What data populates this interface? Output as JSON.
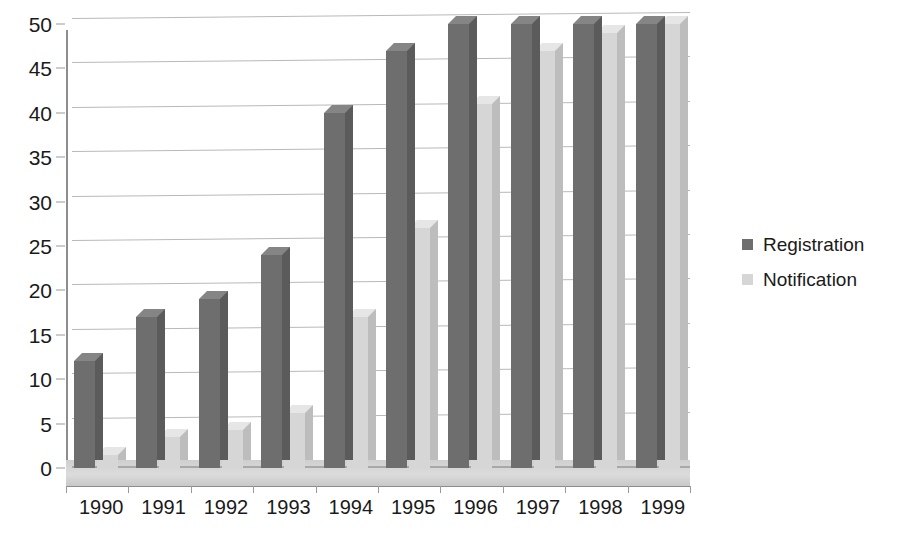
{
  "chart_data": {
    "type": "bar",
    "title": "",
    "subtitle": "",
    "xlabel": "",
    "ylabel": "",
    "categories": [
      "1990",
      "1991",
      "1992",
      "1993",
      "1994",
      "1995",
      "1996",
      "1997",
      "1998",
      "1999"
    ],
    "series": [
      {
        "name": "Registration",
        "color": "#6e6e6e",
        "values": [
          12,
          17,
          19,
          24,
          40,
          47,
          50,
          50,
          50,
          50
        ]
      },
      {
        "name": "Notification",
        "color": "#d6d6d6",
        "values": [
          1.5,
          3.5,
          4.3,
          6.2,
          17,
          27,
          41,
          47,
          49,
          50
        ]
      }
    ],
    "ylim": [
      0,
      50
    ],
    "ytick_values": [
      0,
      5,
      10,
      15,
      20,
      25,
      30,
      35,
      40,
      45,
      50
    ],
    "ytick_labels": [
      "0",
      "5",
      "10",
      "15",
      "20",
      "25",
      "30",
      "35",
      "40",
      "45",
      "50"
    ],
    "grid": true,
    "grid_axis": "y",
    "legend_position": "right",
    "style": "3d-column",
    "clipped_at_top": [
      "1996 Registration",
      "1997 Registration",
      "1998 Registration",
      "1999 Registration",
      "1999 Notification"
    ]
  },
  "legend": {
    "entries": [
      {
        "label": "Registration",
        "swatch": "dark"
      },
      {
        "label": "Notification",
        "swatch": "light"
      }
    ]
  }
}
